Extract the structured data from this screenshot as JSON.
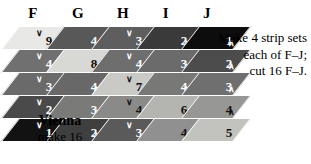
{
  "diagram": {
    "title_block": "Vienna",
    "make_label": "make 16",
    "column_headers": [
      {
        "label": "F",
        "x": 22
      },
      {
        "label": "G",
        "x": 67
      },
      {
        "label": "H",
        "x": 112
      },
      {
        "label": "I",
        "x": 155
      },
      {
        "label": "J",
        "x": 196
      }
    ],
    "annotation": {
      "line1": "Make 4 strip sets",
      "line2": "each of F–J;",
      "line3": "cut 16 F–J."
    },
    "marks": {
      "down": "∨",
      "up": "∧"
    },
    "strips": [
      {
        "name": "F",
        "left": 10,
        "cells": [
          {
            "value": "9",
            "fill": "#e8e8e6",
            "text": "dark",
            "mark": "down"
          },
          {
            "value": "4",
            "fill": "#707070",
            "text": "light",
            "mark": "down"
          },
          {
            "value": "3",
            "fill": "#6a6a6a",
            "text": "light",
            "mark": "down"
          },
          {
            "value": "2",
            "fill": "#4a4a4a",
            "text": "light",
            "mark": "down"
          },
          {
            "value": "1",
            "fill": "#121212",
            "text": "light",
            "mark": "down"
          }
        ]
      },
      {
        "name": "G",
        "left": 55,
        "cells": [
          {
            "value": "4",
            "fill": "#585858",
            "text": "light",
            "mark": "none"
          },
          {
            "value": "8",
            "fill": "#d8d8d4",
            "text": "dark",
            "mark": "up"
          },
          {
            "value": "4",
            "fill": "#686868",
            "text": "light",
            "mark": "up"
          },
          {
            "value": "3",
            "fill": "#7a7a78",
            "text": "light",
            "mark": "up"
          },
          {
            "value": "2",
            "fill": "#3f3f3f",
            "text": "light",
            "mark": "up"
          }
        ]
      },
      {
        "name": "H",
        "left": 100,
        "cells": [
          {
            "value": "3",
            "fill": "#5e5e5e",
            "text": "light",
            "mark": "down"
          },
          {
            "value": "4",
            "fill": "#6e6e6e",
            "text": "light",
            "mark": "down"
          },
          {
            "value": "7",
            "fill": "#c9c9c5",
            "text": "dark",
            "mark": "down"
          },
          {
            "value": "4",
            "fill": "#8a8a88",
            "text": "dark",
            "mark": "down"
          },
          {
            "value": "3",
            "fill": "#5a5a5a",
            "text": "light",
            "mark": "down"
          }
        ]
      },
      {
        "name": "I",
        "left": 145,
        "cells": [
          {
            "value": "2",
            "fill": "#3a3a3a",
            "text": "light",
            "mark": "up"
          },
          {
            "value": "3",
            "fill": "#6b6b6b",
            "text": "light",
            "mark": "up"
          },
          {
            "value": "4",
            "fill": "#787876",
            "text": "light",
            "mark": "up"
          },
          {
            "value": "6",
            "fill": "#b4b4b0",
            "text": "dark",
            "mark": "up"
          },
          {
            "value": "4",
            "fill": "#909090",
            "text": "dark",
            "mark": "none"
          }
        ]
      },
      {
        "name": "J",
        "left": 190,
        "cells": [
          {
            "value": "1",
            "fill": "#0d0d0d",
            "text": "light",
            "mark": "up"
          },
          {
            "value": "2",
            "fill": "#4c4c4c",
            "text": "light",
            "mark": "up"
          },
          {
            "value": "3",
            "fill": "#6f6f6f",
            "text": "light",
            "mark": "up"
          },
          {
            "value": "4",
            "fill": "#979795",
            "text": "dark",
            "mark": "up"
          },
          {
            "value": "5",
            "fill": "#c2c2be",
            "text": "dark",
            "mark": "none"
          }
        ]
      }
    ]
  }
}
